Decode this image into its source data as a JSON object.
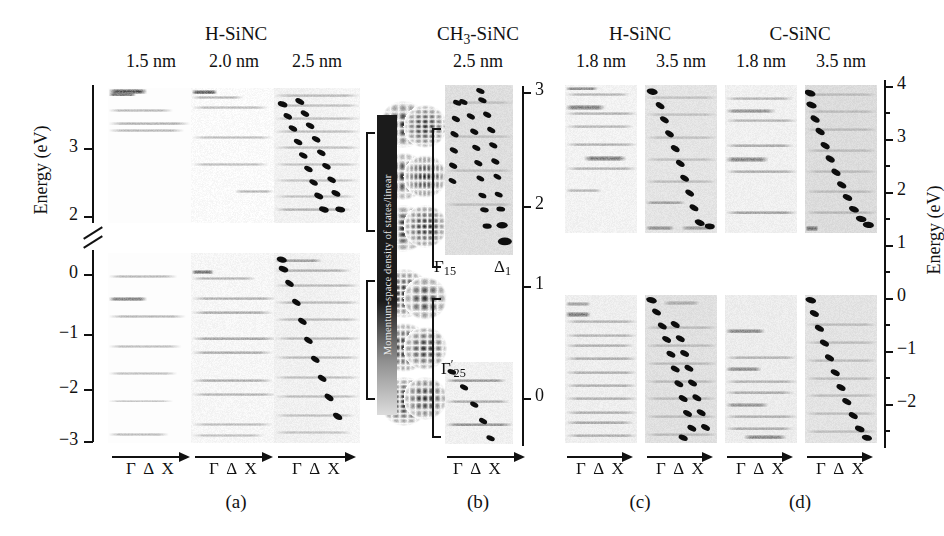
{
  "figure": {
    "caption_letters": [
      {
        "label": "(a)",
        "x": 236,
        "y": 492
      },
      {
        "label": "(b)",
        "x": 478,
        "y": 492
      },
      {
        "label": "(c)",
        "x": 640,
        "y": 492
      },
      {
        "label": "(d)",
        "x": 800,
        "y": 492
      }
    ],
    "group_titles": [
      {
        "label": "H-SiNC",
        "x": 236,
        "y": 24
      },
      {
        "label": "CH₃-SiNC",
        "x": 478,
        "y": 24
      },
      {
        "label": "H-SiNC",
        "x": 640,
        "y": 24
      },
      {
        "label": "C-SiNC",
        "x": 800,
        "y": 24
      }
    ],
    "size_titles": [
      {
        "label": "1.5 nm",
        "x": 151,
        "y": 52
      },
      {
        "label": "2.0 nm",
        "x": 234,
        "y": 52
      },
      {
        "label": "2.5 nm",
        "x": 317,
        "y": 52
      },
      {
        "label": "2.5 nm",
        "x": 478,
        "y": 52
      },
      {
        "label": "1.8 nm",
        "x": 601,
        "y": 52
      },
      {
        "label": "3.5 nm",
        "x": 681,
        "y": 52
      },
      {
        "label": "1.8 nm",
        "x": 761,
        "y": 52
      },
      {
        "label": "3.5 nm",
        "x": 841,
        "y": 52
      }
    ],
    "k_path_label": "Γ Δ X",
    "k_path_positions": [
      {
        "x": 151,
        "y": 460
      },
      {
        "x": 234,
        "y": 460
      },
      {
        "x": 317,
        "y": 460
      },
      {
        "x": 478,
        "y": 460
      },
      {
        "x": 601,
        "y": 460
      },
      {
        "x": 681,
        "y": 460
      },
      {
        "x": 761,
        "y": 460
      },
      {
        "x": 841,
        "y": 460
      }
    ],
    "colorbar": {
      "label": "Momentum-space density of states/linear",
      "orientation": "vertical"
    },
    "band_symmetry_labels": [
      {
        "label": "Γ",
        "sub": "15",
        "prime": false,
        "x": 440,
        "y": 262
      },
      {
        "label": "Δ",
        "sub": "1",
        "prime": false,
        "x": 500,
        "y": 262
      },
      {
        "label": "Γ",
        "sub": "25",
        "prime": true,
        "x": 441,
        "y": 368
      }
    ]
  },
  "axes": {
    "left": {
      "title": "Energy (eV)",
      "ticks": [
        "3",
        "2",
        "0",
        "−1",
        "−2",
        "−3"
      ],
      "has_break": true,
      "break_note": "axis break between 2 and 0"
    },
    "middle": {
      "title": "",
      "ticks": [
        "3",
        "2",
        "1",
        "0"
      ]
    },
    "right": {
      "title": "Energy (eV)",
      "ticks": [
        "4",
        "3",
        "2",
        "1",
        "0",
        "−1",
        "−2"
      ]
    }
  },
  "chart_data": {
    "type": "heatmap",
    "xlabel": "Γ Δ X",
    "ylabel": "Energy (eV)",
    "colorbar_label": "Momentum-space density of states/linear",
    "panels": [
      {
        "letter": "(a)",
        "group": "H-SiNC",
        "columns": [
          {
            "size": "1.5 nm",
            "has_dispersion_markers": false
          },
          {
            "size": "2.0 nm",
            "has_dispersion_markers": false
          },
          {
            "size": "2.5 nm",
            "has_dispersion_markers": true
          }
        ],
        "axis": "left",
        "ylim_upper": [
          1.9,
          3.9
        ],
        "ylim_lower": [
          -3.2,
          0.25
        ],
        "ticks": [
          "3",
          "2",
          "0",
          "-1",
          "-2",
          "-3"
        ]
      },
      {
        "letter": "(b)",
        "group": "CH₃-SiNC",
        "columns": [
          {
            "size": "2.5 nm",
            "has_dispersion_markers": true
          }
        ],
        "axis": "middle",
        "ticks": [
          "3",
          "2",
          "1",
          "0"
        ],
        "symmetry_points": [
          "Γ₁₅",
          "Δ₁",
          "Γ₂₅'"
        ]
      },
      {
        "letter": "(c)",
        "group": "H-SiNC",
        "columns": [
          {
            "size": "1.8 nm",
            "has_dispersion_markers": false
          },
          {
            "size": "3.5 nm",
            "has_dispersion_markers": true
          }
        ],
        "axis": "right",
        "ticks": [
          "4",
          "3",
          "2",
          "1",
          "0",
          "-1",
          "-2"
        ]
      },
      {
        "letter": "(d)",
        "group": "C-SiNC",
        "columns": [
          {
            "size": "1.8 nm",
            "has_dispersion_markers": false
          },
          {
            "size": "3.5 nm",
            "has_dispersion_markers": true
          }
        ],
        "axis": "right",
        "ticks": [
          "4",
          "3",
          "2",
          "1",
          "0",
          "-1",
          "-2"
        ]
      }
    ],
    "wavefunction_insets": {
      "count": 12,
      "left_column_upper": 3,
      "left_column_lower": 3,
      "right_column_upper": 3,
      "right_column_lower": 3,
      "description": "isosurface/charge-density disks"
    }
  }
}
